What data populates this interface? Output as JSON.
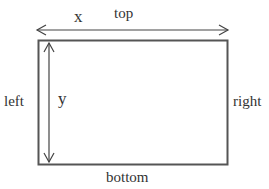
{
  "diagram": {
    "labels": {
      "top": "top",
      "bottom": "bottom",
      "left": "left",
      "right": "right",
      "x": "x",
      "y": "y"
    },
    "colors": {
      "stroke": "#555555",
      "text": "#333333",
      "background": "#ffffff"
    },
    "rectangle": {
      "x": 38,
      "y": 40,
      "width": 189,
      "height": 124
    },
    "horizontal_arrow": {
      "x1": 36,
      "x2": 228,
      "y": 30,
      "label": "x",
      "double_headed": true
    },
    "vertical_arrow": {
      "x": 49,
      "y1": 43,
      "y2": 162,
      "label": "y",
      "double_headed": true
    }
  }
}
